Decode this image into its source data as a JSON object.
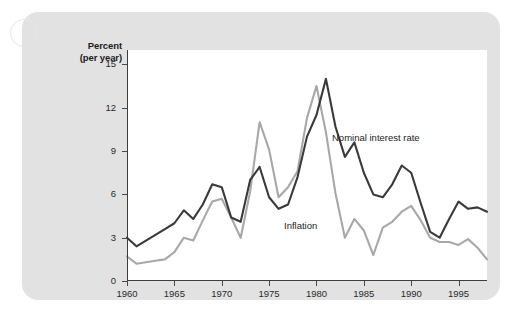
{
  "figure": {
    "background_color": "#e2e2e2",
    "plot_background_color": "#ffffff",
    "corner_marker": "partial-circle"
  },
  "chart_data": {
    "type": "line",
    "title": "",
    "subtitle": "",
    "xlabel": "",
    "ylabel": "Percent (per year)",
    "ylabel_line1": "Percent",
    "ylabel_line2": "(per year)",
    "grid": false,
    "legend_position": "inline-annotations",
    "xlim": [
      1960,
      1998
    ],
    "ylim": [
      0,
      16
    ],
    "yticks": [
      0,
      3,
      6,
      9,
      12,
      15
    ],
    "ytick_labels": [
      "0",
      "3",
      "6",
      "9",
      "12",
      "15"
    ],
    "xticks": [
      1960,
      1965,
      1970,
      1975,
      1980,
      1985,
      1990,
      1995
    ],
    "xtick_labels": [
      "1960",
      "1965",
      "1970",
      "1975",
      "1980",
      "1985",
      "1990",
      "1995"
    ],
    "x": [
      1960,
      1961,
      1962,
      1963,
      1964,
      1965,
      1966,
      1967,
      1968,
      1969,
      1970,
      1971,
      1972,
      1973,
      1974,
      1975,
      1976,
      1977,
      1978,
      1979,
      1980,
      1981,
      1982,
      1983,
      1984,
      1985,
      1986,
      1987,
      1988,
      1989,
      1990,
      1991,
      1992,
      1993,
      1994,
      1995,
      1996,
      1997,
      1998
    ],
    "series": [
      {
        "name": "Nominal interest rate",
        "color": "#3a3a3a",
        "values": [
          3.0,
          2.4,
          2.8,
          3.2,
          3.6,
          4.0,
          4.9,
          4.3,
          5.3,
          6.7,
          6.5,
          4.4,
          4.1,
          7.0,
          7.9,
          5.8,
          5.0,
          5.3,
          7.2,
          10.0,
          11.5,
          14.0,
          10.7,
          8.6,
          9.6,
          7.5,
          6.0,
          5.8,
          6.7,
          8.0,
          7.5,
          5.4,
          3.4,
          3.0,
          4.3,
          5.5,
          5.0,
          5.1,
          4.8
        ]
      },
      {
        "name": "Inflation",
        "color": "#a8a8a8",
        "values": [
          1.7,
          1.2,
          1.3,
          1.4,
          1.5,
          2.0,
          3.0,
          2.8,
          4.2,
          5.5,
          5.7,
          4.4,
          3.0,
          6.2,
          11.0,
          9.1,
          5.8,
          6.5,
          7.6,
          11.3,
          13.5,
          10.3,
          6.1,
          3.0,
          4.3,
          3.5,
          1.8,
          3.7,
          4.1,
          4.8,
          5.2,
          4.2,
          3.0,
          2.7,
          2.7,
          2.5,
          2.9,
          2.3,
          1.5
        ]
      }
    ],
    "annotations": [
      {
        "text": "Nominal interest rate",
        "series": "Nominal interest rate"
      },
      {
        "text": "Inflation",
        "series": "Inflation"
      }
    ]
  }
}
